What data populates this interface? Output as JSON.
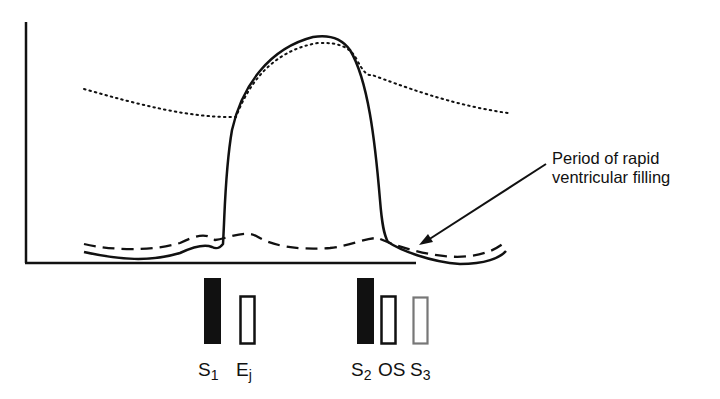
{
  "figure": {
    "curves": [
      {
        "name": "ventricular-pressure",
        "style": "solid",
        "description": "Ventricular pressure trace"
      },
      {
        "name": "arterial-pressure",
        "style": "dotted",
        "description": "Aortic/arterial pressure trace"
      },
      {
        "name": "atrial-pressure",
        "style": "dashed",
        "description": "Atrial pressure trace"
      }
    ],
    "annotation": {
      "line1": "Period of rapid",
      "line2": "ventricular filling"
    },
    "markers": [
      {
        "id": "S1",
        "base": "S",
        "sub": "1",
        "fill": "solid",
        "color": "#000000"
      },
      {
        "id": "Ej",
        "base": "E",
        "sub": "j",
        "fill": "outline",
        "color": "#000000"
      },
      {
        "id": "S2",
        "base": "S",
        "sub": "2",
        "fill": "solid",
        "color": "#000000"
      },
      {
        "id": "OS",
        "base": "OS",
        "sub": "",
        "fill": "outline",
        "color": "#000000"
      },
      {
        "id": "S3",
        "base": "S",
        "sub": "3",
        "fill": "outline",
        "color": "#777777"
      }
    ]
  }
}
